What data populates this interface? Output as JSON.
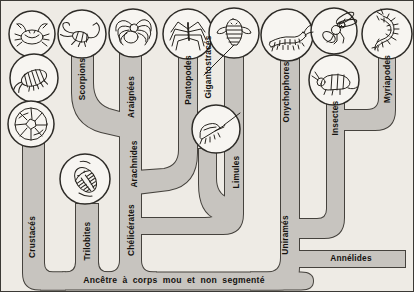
{
  "figure": {
    "type": "phylogenetic-tree",
    "root_label": "Ancêtre à corps mou et non segmenté",
    "labels": {
      "crustaces": "Crustacés",
      "trilobites": "Trilobites",
      "chelicerates": "Chélicérates",
      "arachnides": "Arachnides",
      "scorpions": "Scorpions",
      "araignees": "Araignées",
      "pantopodes": "Pantopodes",
      "gigantostraces": "Gigantostracés",
      "limules": "Limules",
      "onychophores": "Onychophores",
      "unirames": "Uniramés",
      "insectes": "Insectes",
      "myriapodes": "Myriapodes",
      "annelides": "Annélides"
    },
    "topology": [
      {
        "branch": "Crustacés",
        "from": "root"
      },
      {
        "branch": "Trilobites",
        "from": "root"
      },
      {
        "branch": "Chélicérates",
        "from": "root",
        "splits_into": [
          "Arachnides",
          "Pantopodes",
          "Limules",
          "Gigantostracés"
        ]
      },
      {
        "branch": "Arachnides",
        "from": "Chélicérates",
        "splits_into": [
          "Scorpions",
          "Araignées"
        ]
      },
      {
        "branch": "Uniramés",
        "from": "root",
        "splits_into": [
          "Onychophores",
          "Insectes",
          "Myriapodes"
        ]
      },
      {
        "branch": "Annélides",
        "from": "root"
      }
    ],
    "illustrations": {
      "crustaces": [
        "crab",
        "woodlouse",
        "barnacle"
      ],
      "trilobites": "trilobite",
      "scorpions": "scorpion",
      "araignees": "spider",
      "pantopodes": "sea-spider",
      "gigantostraces": "eurypterid",
      "limules": "horseshoe-crab",
      "onychophores": "velvet-worm",
      "insectes": [
        "fly",
        "springtail"
      ],
      "myriapodes": "centipede"
    },
    "colors": {
      "background": "#eeebe5",
      "branch_fill": "#c7c4bf",
      "branch_outline": "#45423d",
      "text": "#14120f"
    }
  }
}
